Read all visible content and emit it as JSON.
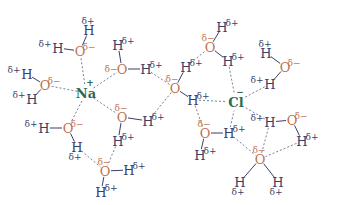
{
  "colors": {
    "oxygen": "#c0714f",
    "hydrogen": "#3a3f68",
    "ion": "#2f6a4e",
    "dashed": "#6a6f8a"
  },
  "ions": [
    {
      "id": "Na",
      "label": "Na",
      "charge": "+",
      "x": 86,
      "y": 93
    },
    {
      "id": "Cl",
      "label": "Cl",
      "charge": "−",
      "x": 236,
      "y": 102
    }
  ],
  "labels": {
    "delta_plus": "δ+",
    "delta_minus": "δ−",
    "oxygen": "O",
    "hydrogen": "H"
  },
  "atoms": [
    {
      "id": "o1",
      "el": "O",
      "x": 80,
      "y": 51,
      "charge": "δ−",
      "cdx": 9,
      "cdy": -4
    },
    {
      "id": "h1a",
      "el": "H",
      "x": 89,
      "y": 30,
      "charge": "δ+",
      "cdx": -1,
      "cdy": -9
    },
    {
      "id": "h1b",
      "el": "H",
      "x": 58,
      "y": 48,
      "charge": "δ+",
      "cdx": -13,
      "cdy": -4
    },
    {
      "id": "o2",
      "el": "O",
      "x": 122,
      "y": 69,
      "charge": "δ−",
      "cdx": -11,
      "cdy": 0
    },
    {
      "id": "h2a",
      "el": "H",
      "x": 118,
      "y": 45,
      "charge": "δ+",
      "cdx": 10,
      "cdy": -4
    },
    {
      "id": "h2b",
      "el": "H",
      "x": 146,
      "y": 69,
      "charge": "δ+",
      "cdx": 10,
      "cdy": -4
    },
    {
      "id": "o3",
      "el": "O",
      "x": 45,
      "y": 85,
      "charge": "δ−",
      "cdx": 9,
      "cdy": -4
    },
    {
      "id": "h3a",
      "el": "H",
      "x": 27,
      "y": 74,
      "charge": "δ+",
      "cdx": -13,
      "cdy": -4
    },
    {
      "id": "h3b",
      "el": "H",
      "x": 32,
      "y": 99,
      "charge": "δ+",
      "cdx": -13,
      "cdy": -4
    },
    {
      "id": "o4",
      "el": "O",
      "x": 68,
      "y": 128,
      "charge": "δ−",
      "cdx": 9,
      "cdy": -4
    },
    {
      "id": "h4a",
      "el": "H",
      "x": 44,
      "y": 128,
      "charge": "δ+",
      "cdx": -13,
      "cdy": -4
    },
    {
      "id": "h4b",
      "el": "H",
      "x": 77,
      "y": 147,
      "charge": "δ+",
      "cdx": -2,
      "cdy": 10
    },
    {
      "id": "o5",
      "el": "O",
      "x": 122,
      "y": 117,
      "charge": "δ−",
      "cdx": -1,
      "cdy": -9
    },
    {
      "id": "h5a",
      "el": "H",
      "x": 148,
      "y": 121,
      "charge": "δ+",
      "cdx": 10,
      "cdy": -4
    },
    {
      "id": "h5b",
      "el": "H",
      "x": 118,
      "y": 141,
      "charge": "δ+",
      "cdx": 10,
      "cdy": -4
    },
    {
      "id": "o6",
      "el": "O",
      "x": 105,
      "y": 171,
      "charge": "δ−",
      "cdx": -1,
      "cdy": -9
    },
    {
      "id": "h6a",
      "el": "H",
      "x": 129,
      "y": 170,
      "charge": "δ+",
      "cdx": 10,
      "cdy": -4
    },
    {
      "id": "h6b",
      "el": "H",
      "x": 101,
      "y": 192,
      "charge": "δ+",
      "cdx": 10,
      "cdy": -4
    },
    {
      "id": "o7",
      "el": "O",
      "x": 175,
      "y": 88,
      "charge": "δ−",
      "cdx": -3,
      "cdy": -9
    },
    {
      "id": "h7a",
      "el": "H",
      "x": 186,
      "y": 67,
      "charge": "δ+",
      "cdx": 10,
      "cdy": -4
    },
    {
      "id": "h7b",
      "el": "H",
      "x": 193,
      "y": 100,
      "charge": "δ+",
      "cdx": 10,
      "cdy": -4
    },
    {
      "id": "o8",
      "el": "O",
      "x": 210,
      "y": 47,
      "charge": "δ−",
      "cdx": -2,
      "cdy": -9
    },
    {
      "id": "h8a",
      "el": "H",
      "x": 222,
      "y": 27,
      "charge": "δ+",
      "cdx": 10,
      "cdy": -4
    },
    {
      "id": "h8b",
      "el": "H",
      "x": 228,
      "y": 61,
      "charge": "δ+",
      "cdx": 10,
      "cdy": -4
    },
    {
      "id": "o9",
      "el": "O",
      "x": 205,
      "y": 133,
      "charge": "δ−",
      "cdx": -1,
      "cdy": -9
    },
    {
      "id": "h9a",
      "el": "H",
      "x": 229,
      "y": 133,
      "charge": "δ+",
      "cdx": 10,
      "cdy": -4
    },
    {
      "id": "h9b",
      "el": "H",
      "x": 200,
      "y": 155,
      "charge": "δ+",
      "cdx": 10,
      "cdy": -4
    },
    {
      "id": "o10",
      "el": "O",
      "x": 285,
      "y": 67,
      "charge": "δ−",
      "cdx": 9,
      "cdy": -4
    },
    {
      "id": "h10a",
      "el": "H",
      "x": 266,
      "y": 53,
      "charge": "δ+",
      "cdx": -1,
      "cdy": -9
    },
    {
      "id": "h10b",
      "el": "H",
      "x": 270,
      "y": 84,
      "charge": "δ+",
      "cdx": -13,
      "cdy": -4
    },
    {
      "id": "o11",
      "el": "O",
      "x": 292,
      "y": 120,
      "charge": "δ−",
      "cdx": 9,
      "cdy": -4
    },
    {
      "id": "h11a",
      "el": "H",
      "x": 270,
      "y": 122,
      "charge": "δ+",
      "cdx": -13,
      "cdy": -4
    },
    {
      "id": "h11b",
      "el": "H",
      "x": 302,
      "y": 141,
      "charge": "δ+",
      "cdx": 10,
      "cdy": -4
    },
    {
      "id": "o12",
      "el": "O",
      "x": 260,
      "y": 159,
      "charge": "δ−",
      "cdx": -1,
      "cdy": -9
    },
    {
      "id": "h12a",
      "el": "H",
      "x": 240,
      "y": 182,
      "charge": "δ+",
      "cdx": -2,
      "cdy": 10
    },
    {
      "id": "h12b",
      "el": "H",
      "x": 278,
      "y": 182,
      "charge": "δ+",
      "cdx": -2,
      "cdy": 10
    }
  ],
  "bonds": [
    [
      "o1",
      "h1a"
    ],
    [
      "o1",
      "h1b"
    ],
    [
      "o2",
      "h2a"
    ],
    [
      "o2",
      "h2b"
    ],
    [
      "o3",
      "h3a"
    ],
    [
      "o3",
      "h3b"
    ],
    [
      "o4",
      "h4a"
    ],
    [
      "o4",
      "h4b"
    ],
    [
      "o5",
      "h5a"
    ],
    [
      "o5",
      "h5b"
    ],
    [
      "o6",
      "h6a"
    ],
    [
      "o6",
      "h6b"
    ],
    [
      "o7",
      "h7a"
    ],
    [
      "o7",
      "h7b"
    ],
    [
      "o8",
      "h8a"
    ],
    [
      "o8",
      "h8b"
    ],
    [
      "o9",
      "h9a"
    ],
    [
      "o9",
      "h9b"
    ],
    [
      "o10",
      "h10a"
    ],
    [
      "o10",
      "h10b"
    ],
    [
      "o11",
      "h11a"
    ],
    [
      "o11",
      "h11b"
    ],
    [
      "o12",
      "h12a"
    ],
    [
      "o12",
      "h12b"
    ]
  ],
  "interactions": [
    [
      "Na",
      "o1"
    ],
    [
      "Na",
      "o2"
    ],
    [
      "Na",
      "o3"
    ],
    [
      "Na",
      "o4"
    ],
    [
      "Na",
      "o5"
    ],
    [
      "h4b",
      "o6"
    ],
    [
      "h5b",
      "o6"
    ],
    [
      "h2b",
      "o7"
    ],
    [
      "h7a",
      "o8"
    ],
    [
      "o7",
      "h5a"
    ],
    [
      "h7b",
      "Cl"
    ],
    [
      "h8b",
      "Cl"
    ],
    [
      "h10b",
      "Cl"
    ],
    [
      "h9a",
      "Cl"
    ],
    [
      "h11a",
      "Cl"
    ],
    [
      "h7b",
      "o9"
    ],
    [
      "h9a",
      "o12"
    ],
    [
      "h11a",
      "o12"
    ],
    [
      "h11b",
      "o12"
    ]
  ]
}
